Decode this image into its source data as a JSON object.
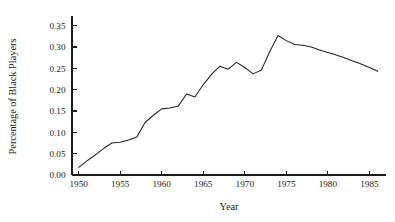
{
  "chart_data": {
    "type": "line",
    "title": "",
    "xlabel": "Year",
    "ylabel": "Percentage of Black Players",
    "xlim": [
      1949.2,
      1987.0
    ],
    "ylim": [
      0.0,
      0.368
    ],
    "xticks": [
      1950,
      1955,
      1960,
      1965,
      1970,
      1975,
      1980,
      1985
    ],
    "xticklabels": [
      "1950",
      "1955",
      "1960",
      "1965",
      "1970",
      "1975",
      "1980",
      "1985"
    ],
    "yticks": [
      0.0,
      0.05,
      0.1,
      0.15,
      0.2,
      0.25,
      0.3,
      0.35
    ],
    "yticklabels": [
      "0.00",
      "0.05",
      "0.10",
      "0.15",
      "0.20",
      "0.25",
      "0.30",
      "0.35"
    ],
    "grid": false,
    "legend": false,
    "line_color": "#232323",
    "x": [
      1950,
      1951,
      1952,
      1953,
      1954,
      1955,
      1956,
      1957,
      1958,
      1959,
      1960,
      1961,
      1962,
      1963,
      1964,
      1965,
      1966,
      1967,
      1968,
      1969,
      1970,
      1971,
      1972,
      1973,
      1974,
      1975,
      1976,
      1977,
      1978,
      1979,
      1980,
      1981,
      1982,
      1983,
      1984,
      1985,
      1986
    ],
    "y": [
      0.018,
      0.033,
      0.047,
      0.062,
      0.075,
      0.077,
      0.082,
      0.089,
      0.123,
      0.14,
      0.155,
      0.157,
      0.162,
      0.19,
      0.183,
      0.212,
      0.236,
      0.255,
      0.248,
      0.264,
      0.252,
      0.237,
      0.246,
      0.289,
      0.327,
      0.315,
      0.306,
      0.304,
      0.3,
      0.293,
      0.287,
      0.281,
      0.275,
      0.267,
      0.26,
      0.252,
      0.243
    ]
  }
}
